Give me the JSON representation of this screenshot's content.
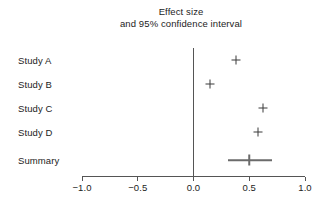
{
  "chart_data": {
    "type": "scatter",
    "title": "Effect size and 95% confidence interval",
    "title_lines": [
      "Effect size",
      "and 95% confidence interval"
    ],
    "xlabel": "",
    "ylabel": "",
    "xlim": [
      -1.0,
      1.0
    ],
    "xticks": [
      -1.0,
      -0.5,
      0.0,
      0.5,
      1.0
    ],
    "xtick_labels": [
      "−1.0",
      "−0.5",
      "0.0",
      "0.5",
      "1.0"
    ],
    "grid": false,
    "legend": false,
    "reference_line": 0.0,
    "categories": [
      "Study A",
      "Study B",
      "Study C",
      "Study D",
      "Summary"
    ],
    "rows": [
      {
        "label": "Study A",
        "estimate": 0.38,
        "ci_low": null,
        "ci_high": null,
        "is_summary": false
      },
      {
        "label": "Study B",
        "estimate": 0.15,
        "ci_low": null,
        "ci_high": null,
        "is_summary": false
      },
      {
        "label": "Study C",
        "estimate": 0.62,
        "ci_low": null,
        "ci_high": null,
        "is_summary": false
      },
      {
        "label": "Study D",
        "estimate": 0.58,
        "ci_low": null,
        "ci_high": null,
        "is_summary": false
      },
      {
        "label": "Summary",
        "estimate": 0.5,
        "ci_low": 0.31,
        "ci_high": 0.7,
        "is_summary": true
      }
    ],
    "colors": {
      "background": "#ffffff",
      "marker": "#3a3a3a",
      "axis": "#555555",
      "summary": "#6b6b6b",
      "text": "#1c1c1c"
    }
  },
  "geometry": {
    "x_pixel_min": 82,
    "x_pixel_max": 305,
    "x_value_min": -1.0,
    "x_value_max": 1.0,
    "axis_y": 176,
    "tick_height": 4,
    "tick_label_y": 182,
    "zero_line_top": 48,
    "zero_line_bottom": 176,
    "row_y": [
      60,
      84,
      108,
      132,
      160
    ]
  }
}
